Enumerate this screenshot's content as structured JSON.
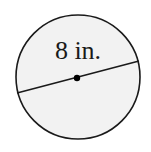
{
  "diagram": {
    "type": "circle-with-diameter",
    "label": "8 in.",
    "circle": {
      "cx": 78,
      "cy": 77,
      "r": 62,
      "fill": "#f2f2f2",
      "stroke": "#1a1a1a"
    },
    "diameter": {
      "x1": 17,
      "y1": 93,
      "x2": 139,
      "y2": 61,
      "stroke": "#1a1a1a"
    },
    "center_point": {
      "cx": 77,
      "cy": 78,
      "r": 3.2,
      "fill": "#000000"
    }
  }
}
